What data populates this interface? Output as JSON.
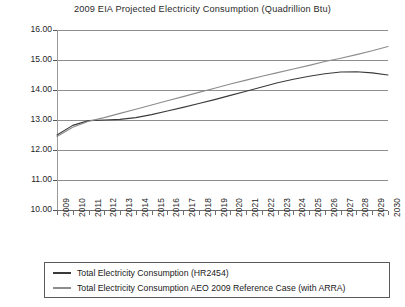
{
  "chart_data": {
    "type": "line",
    "title": "2009 EIA Projected Electricity Consumption (Quadrillion Btu)",
    "xlabel": "",
    "ylabel": "",
    "ylim": [
      10.0,
      16.0
    ],
    "y_ticks": [
      "10.00",
      "11.00",
      "12.00",
      "13.00",
      "14.00",
      "15.00",
      "16.00"
    ],
    "y_tick_values": [
      10.0,
      11.0,
      12.0,
      13.0,
      14.0,
      15.0,
      16.0
    ],
    "grid": true,
    "legend_position": "bottom",
    "categories": [
      "2009",
      "2010",
      "2011",
      "2012",
      "2013",
      "2014",
      "2015",
      "2016",
      "2017",
      "2018",
      "2019",
      "2020",
      "2021",
      "2022",
      "2023",
      "2024",
      "2025",
      "2026",
      "2027",
      "2028",
      "2029",
      "2030"
    ],
    "series": [
      {
        "name": "Total Electricity Consumption (HR2454)",
        "color": "#3a3a3a",
        "values": [
          12.5,
          12.82,
          12.98,
          13.0,
          13.02,
          13.08,
          13.18,
          13.3,
          13.42,
          13.55,
          13.68,
          13.82,
          13.96,
          14.1,
          14.24,
          14.36,
          14.46,
          14.54,
          14.6,
          14.61,
          14.57,
          14.5
        ]
      },
      {
        "name": "Total Electricity Consumption AEO 2009 Reference Case (with ARRA)",
        "color": "#8c8c8c",
        "values": [
          12.45,
          12.76,
          12.96,
          13.08,
          13.22,
          13.36,
          13.5,
          13.64,
          13.78,
          13.92,
          14.06,
          14.2,
          14.33,
          14.46,
          14.58,
          14.7,
          14.82,
          14.95,
          15.06,
          15.18,
          15.31,
          15.45
        ]
      }
    ]
  }
}
